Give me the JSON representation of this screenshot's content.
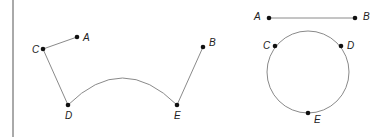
{
  "colors": {
    "line": "#8a8a8a",
    "point": "#111111",
    "label": "#222222",
    "border": "#555555"
  },
  "left_figure": {
    "points": [
      {
        "id": "A",
        "label": "A",
        "x": 77,
        "y": 37
      },
      {
        "id": "B",
        "label": "B",
        "x": 203,
        "y": 47
      },
      {
        "id": "C",
        "label": "C",
        "x": 43,
        "y": 49
      },
      {
        "id": "D",
        "label": "D",
        "x": 68,
        "y": 105
      },
      {
        "id": "E",
        "label": "E",
        "x": 177,
        "y": 105
      }
    ],
    "segments": [
      [
        "C",
        "A"
      ],
      [
        "C",
        "D"
      ],
      [
        "E",
        "B"
      ]
    ],
    "arc": {
      "from": "D",
      "to": "E",
      "apex_y": 78
    }
  },
  "right_figure": {
    "points": [
      {
        "id": "A",
        "label": "A",
        "x": 269,
        "y": 18
      },
      {
        "id": "B",
        "label": "B",
        "x": 355,
        "y": 18
      },
      {
        "id": "C",
        "label": "C",
        "x": 275,
        "y": 46
      },
      {
        "id": "D",
        "label": "D",
        "x": 341,
        "y": 46
      },
      {
        "id": "E",
        "label": "E",
        "x": 308,
        "y": 113
      }
    ],
    "segments": [
      [
        "A",
        "B"
      ]
    ],
    "circle": {
      "cx": 308,
      "cy": 72,
      "r": 41
    }
  }
}
